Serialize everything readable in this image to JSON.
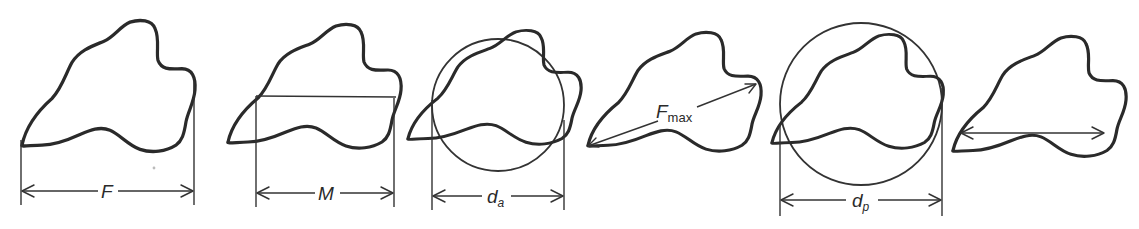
{
  "diagram": {
    "colors": {
      "stroke": "#2a2a2a",
      "background": "#ffffff"
    },
    "panels": [
      {
        "id": "feret",
        "label": "F",
        "subscript": "",
        "measure": "Feret diameter (distance between parallel tangents)"
      },
      {
        "id": "martin",
        "label": "M",
        "subscript": "",
        "measure": "Martin diameter (chord bisecting projected area)"
      },
      {
        "id": "projected-area",
        "label": "d",
        "subscript": "a",
        "measure": "Projected area diameter (circle of equal area)"
      },
      {
        "id": "max-feret",
        "label": "F",
        "subscript": "max",
        "measure": "Maximum Feret diameter"
      },
      {
        "id": "perimeter",
        "label": "d",
        "subscript": "p",
        "measure": "Perimeter diameter (circle of equal perimeter)"
      },
      {
        "id": "max-chord",
        "label": "",
        "subscript": "",
        "measure": "Horizontal chord (unlabeled)"
      }
    ]
  }
}
